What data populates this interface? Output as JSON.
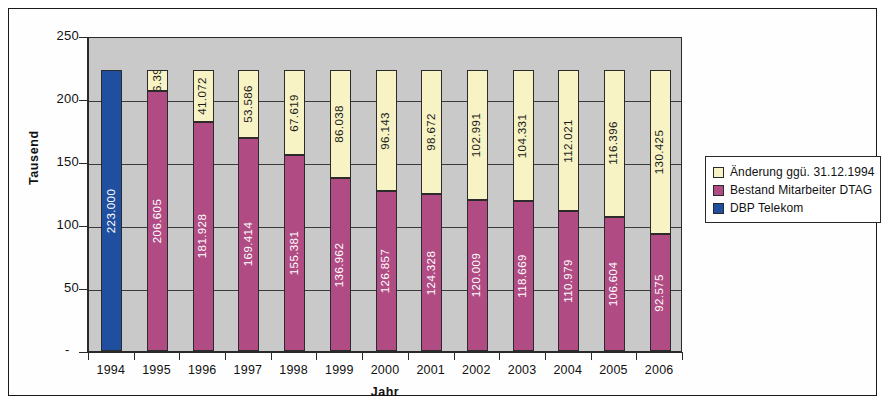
{
  "chart_data": {
    "type": "bar",
    "subtype": "stacked",
    "title": "",
    "xlabel": "Jahr",
    "ylabel": "Tausend",
    "ylim": [
      0,
      250
    ],
    "yticks": [
      "-",
      "50",
      "100",
      "150",
      "200",
      "250"
    ],
    "grid": true,
    "legend_position": "right",
    "categories": [
      "1994",
      "1995",
      "1996",
      "1997",
      "1998",
      "1999",
      "2000",
      "2001",
      "2002",
      "2003",
      "2004",
      "2005",
      "2006"
    ],
    "series": [
      {
        "name": "DBP Telekom",
        "color": "#1f4f9e",
        "labels": [
          "223.000",
          "",
          "",
          "",
          "",
          "",
          "",
          "",
          "",
          "",
          "",
          "",
          ""
        ],
        "values": [
          223.0,
          null,
          null,
          null,
          null,
          null,
          null,
          null,
          null,
          null,
          null,
          null,
          null
        ]
      },
      {
        "name": "Bestand Mitarbeiter DTAG",
        "color": "#b04b84",
        "labels": [
          "",
          "206.605",
          "181.928",
          "169.414",
          "155.381",
          "136.962",
          "126.857",
          "124.328",
          "120.009",
          "118.669",
          "110.979",
          "106.604",
          "92.575"
        ],
        "values": [
          null,
          206.605,
          181.928,
          169.414,
          155.381,
          136.962,
          126.857,
          124.328,
          120.009,
          118.669,
          110.979,
          106.604,
          92.575
        ]
      },
      {
        "name": "Änderung ggü. 31.12.1994",
        "color": "#f7f3c4",
        "labels": [
          "",
          "16.395",
          "41.072",
          "53.586",
          "67.619",
          "86.038",
          "96.143",
          "98.672",
          "102.991",
          "104.331",
          "112.021",
          "116.396",
          "130.425"
        ],
        "values": [
          null,
          16.395,
          41.072,
          53.586,
          67.619,
          86.038,
          96.143,
          98.672,
          102.991,
          104.331,
          112.021,
          116.396,
          130.425
        ]
      }
    ]
  },
  "legend": {
    "items": [
      {
        "label": "Änderung ggü. 31.12.1994",
        "color": "#f7f3c4"
      },
      {
        "label": "Bestand Mitarbeiter DTAG",
        "color": "#b04b84"
      },
      {
        "label": "DBP Telekom",
        "color": "#1f4f9e"
      }
    ]
  }
}
